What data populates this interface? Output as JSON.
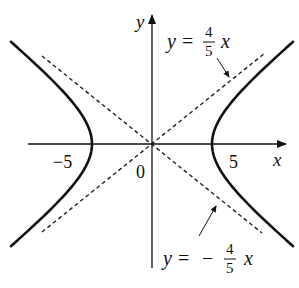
{
  "figure": {
    "axes": {
      "x_label": "x",
      "y_label": "y",
      "origin_label": "0",
      "x_ticks": [
        "−5",
        "5"
      ]
    },
    "asymptotes": [
      {
        "name": "upper",
        "lhs": "y",
        "eq": "=",
        "sign": "",
        "num": "4",
        "den": "5",
        "var": "x"
      },
      {
        "name": "lower",
        "lhs": "y",
        "eq": "=",
        "sign": "−",
        "num": "4",
        "den": "5",
        "var": "x"
      }
    ],
    "colors": {
      "curve": "#111111",
      "axes": "#111111",
      "asymptote": "#222222",
      "background": "#ffffff"
    }
  }
}
